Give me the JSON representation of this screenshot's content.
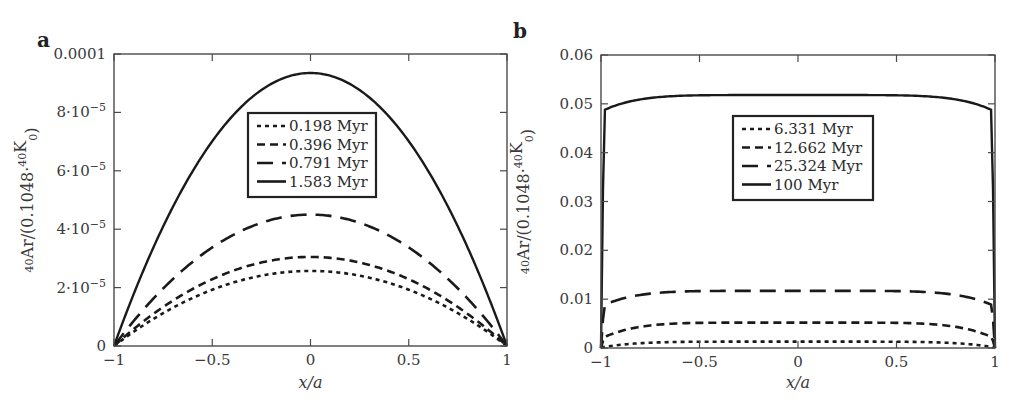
{
  "chart_data": [
    {
      "panel": "a",
      "type": "line",
      "title": "",
      "xlabel": "x/a",
      "ylabel": "40Ar/(0.1048·40K0)",
      "xlim": [
        -1,
        1
      ],
      "ylim": [
        0,
        0.0001
      ],
      "x_ticks": [
        -1,
        -0.5,
        0,
        0.5,
        1
      ],
      "x_tick_labels": [
        "−1",
        "−0.5",
        "0",
        "0.5",
        "1"
      ],
      "y_ticks": [
        0,
        2e-05,
        4e-05,
        6e-05,
        8e-05,
        0.0001
      ],
      "y_tick_labels": [
        "0",
        "2·10⁻⁵",
        "4·10⁻⁵",
        "6·10⁻⁵",
        "8·10⁻⁵",
        "0.0001"
      ],
      "grid": false,
      "legend_position": "upper center",
      "series": [
        {
          "name": "0.198 Myr",
          "style": "dotted",
          "peak": 2.57e-05,
          "shape": "parabola"
        },
        {
          "name": "0.396 Myr",
          "style": "short-dash",
          "peak": 3.05e-05,
          "shape": "parabola"
        },
        {
          "name": "0.791 Myr",
          "style": "long-dash",
          "peak": 4.5e-05,
          "shape": "parabola"
        },
        {
          "name": "1.583 Myr",
          "style": "solid",
          "peak": 9.35e-05,
          "shape": "parabola"
        }
      ]
    },
    {
      "panel": "b",
      "type": "line",
      "title": "",
      "xlabel": "x/a",
      "ylabel": "40Ar/(0.1048·40K0)",
      "xlim": [
        -1,
        1
      ],
      "ylim": [
        0,
        0.06
      ],
      "x_ticks": [
        -1,
        -0.5,
        0,
        0.5,
        1
      ],
      "x_tick_labels": [
        "−1",
        "−0.5",
        "0",
        "0.5",
        "1"
      ],
      "y_ticks": [
        0,
        0.01,
        0.02,
        0.03,
        0.04,
        0.05,
        0.06
      ],
      "y_tick_labels": [
        "0",
        "0.01",
        "0.02",
        "0.03",
        "0.04",
        "0.05",
        "0.06"
      ],
      "grid": false,
      "legend_position": "upper center",
      "series": [
        {
          "name": "6.331 Myr",
          "style": "dotted",
          "peak": 0.0013,
          "edge": 0.0002,
          "shape": "plateau"
        },
        {
          "name": "12.662 Myr",
          "style": "short-dash",
          "peak": 0.0052,
          "edge": 0.0022,
          "shape": "plateau"
        },
        {
          "name": "25.324 Myr",
          "style": "long-dash",
          "peak": 0.0117,
          "edge": 0.0088,
          "shape": "plateau"
        },
        {
          "name": "100 Myr",
          "style": "solid",
          "peak": 0.0518,
          "edge": 0.0487,
          "shape": "plateau"
        }
      ]
    }
  ],
  "panels": {
    "a": {
      "label": "a"
    },
    "b": {
      "label": "b"
    }
  }
}
